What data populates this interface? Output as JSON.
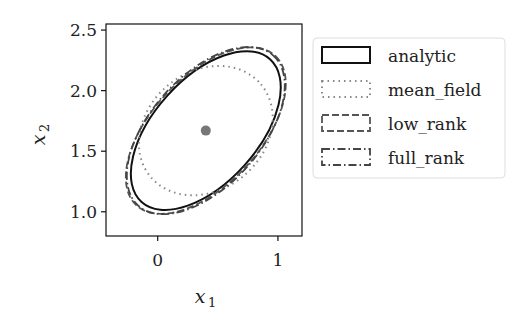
{
  "chart_data": {
    "type": "scatter",
    "title": "",
    "xlabel": "x1",
    "ylabel": "x2",
    "xlim": [
      -0.43,
      1.2
    ],
    "ylim": [
      0.8,
      2.55
    ],
    "xticks": [
      "0",
      "1"
    ],
    "yticks": [
      "1.0",
      "1.5",
      "2.0",
      "2.5"
    ],
    "grid": false,
    "legend_position": "outside right",
    "center_point": {
      "x": 0.4,
      "y": 1.67,
      "color": "#777777"
    },
    "series": [
      {
        "name": "analytic",
        "style": "solid",
        "shape": "ellipse",
        "center": [
          0.4,
          1.67
        ],
        "extent_x": [
          -0.3,
          1.05
        ],
        "extent_y": [
          0.95,
          2.39
        ]
      },
      {
        "name": "mean_field",
        "style": "dotted",
        "shape": "ellipse",
        "center": [
          0.4,
          1.67
        ],
        "extent_x": [
          -0.28,
          1.05
        ],
        "extent_y": [
          1.06,
          2.26
        ]
      },
      {
        "name": "low_rank",
        "style": "dashed",
        "shape": "ellipse",
        "center": [
          0.4,
          1.67
        ],
        "extent_x": [
          -0.33,
          1.1
        ],
        "extent_y": [
          0.9,
          2.42
        ]
      },
      {
        "name": "full_rank",
        "style": "dashdot",
        "shape": "ellipse",
        "center": [
          0.4,
          1.67
        ],
        "extent_x": [
          -0.33,
          1.1
        ],
        "extent_y": [
          0.92,
          2.41
        ]
      }
    ]
  },
  "labels": {
    "x_axis": "x",
    "x_sub": "1",
    "y_axis": "x",
    "y_sub": "2",
    "legend": [
      "analytic",
      "mean_field",
      "low_rank",
      "full_rank"
    ]
  }
}
